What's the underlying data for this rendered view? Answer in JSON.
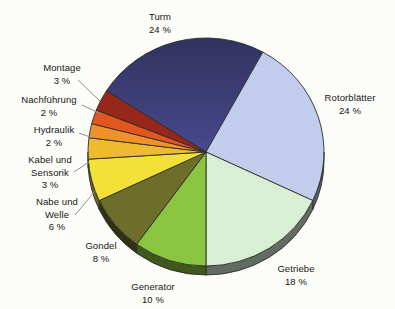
{
  "chart_data": {
    "type": "pie",
    "title": "",
    "unit": "%",
    "direction": "clockwise",
    "start_angle_deg": -57.6,
    "depth_style": "3d",
    "background": "#fcfcf8",
    "outline_color": "#2d2d2d",
    "leader_line_color": "#8f8f8f",
    "slices": [
      {
        "label": "Turm",
        "value": 24,
        "pct_label": "24 %",
        "color": "#41417e",
        "color_top": "#32325f"
      },
      {
        "label": "Rotorblätter",
        "value": 24,
        "pct_label": "24 %",
        "color": "#c2cdee"
      },
      {
        "label": "Getriebe",
        "value": 18,
        "pct_label": "18 %",
        "color": "#d9efd5"
      },
      {
        "label": "Generator",
        "value": 10,
        "pct_label": "10 %",
        "color": "#8bc43e"
      },
      {
        "label": "Gondel",
        "value": 8,
        "pct_label": "8 %",
        "color": "#6e6e2b"
      },
      {
        "label": "Nabe und Welle",
        "value": 6,
        "pct_label": "6 %",
        "color": "#f2e136"
      },
      {
        "label": "Kabel und Sensorik",
        "value": 3,
        "pct_label": "3 %",
        "color": "#eebb2e"
      },
      {
        "label": "Hydraulik",
        "value": 2,
        "pct_label": "2 %",
        "color": "#f0922a"
      },
      {
        "label": "Nachführung",
        "value": 2,
        "pct_label": "2 %",
        "color": "#e2571d"
      },
      {
        "label": "Montage",
        "value": 3,
        "pct_label": "3 %",
        "color": "#97271b"
      }
    ]
  }
}
